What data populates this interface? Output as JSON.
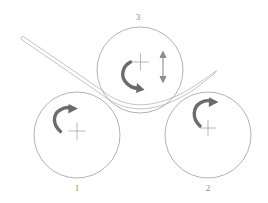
{
  "figure": {
    "name": "three-roll-bending-machine-diagram",
    "background_color": "#ffffff",
    "line_color": "#a9a9a9",
    "arrow_color": "#6b6b6b",
    "label_color": "#8a8a8a",
    "width": 268,
    "height": 203
  },
  "rolls": [
    {
      "label": "1",
      "name": "bottom-left-roll",
      "center": {
        "x": 77,
        "y": 135
      },
      "radius": 43,
      "center_mark": "plus",
      "rotation_arrow": "clockwise-curved-arrow",
      "label_position": "below"
    },
    {
      "label": "2",
      "name": "bottom-right-roll",
      "center": {
        "x": 208,
        "y": 135
      },
      "radius": 43,
      "center_mark": "plus",
      "rotation_arrow": "clockwise-curved-arrow",
      "label_position": "below"
    },
    {
      "label": "3",
      "name": "top-center-roll",
      "center": {
        "x": 140,
        "y": 70
      },
      "radius": 43,
      "center_mark": "plus",
      "rotation_arrow": "clockwise-curved-arrow",
      "vertical_adjust_arrow": "double-headed-vertical-arrow",
      "label_position": "above"
    }
  ],
  "workpiece": {
    "name": "sheet-metal-strip",
    "description": "straight strip entering from upper left, bent around top roll, exiting upper right",
    "entry_tip": {
      "x": 22,
      "y": 37
    },
    "exit_tip": {
      "x": 216,
      "y": 71
    },
    "thickness": 3
  },
  "annotations": {
    "center_mark_glyph": "+",
    "vertical_arrow_glyph": "double-arrow-vertical"
  }
}
